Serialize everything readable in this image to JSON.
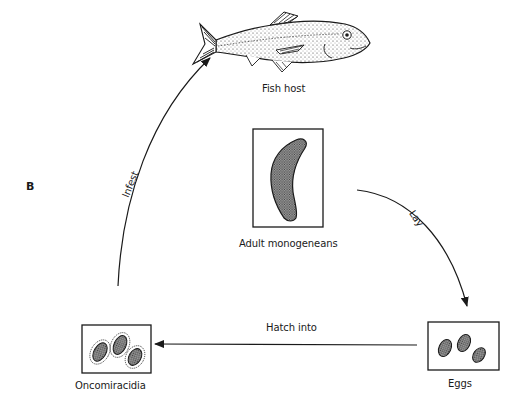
{
  "figure": {
    "panel_letter": "B"
  },
  "stages": [
    {
      "id": "fish-host",
      "label": "Fish host"
    },
    {
      "id": "adult",
      "label": "Adult monogeneans"
    },
    {
      "id": "eggs",
      "label": "Eggs"
    },
    {
      "id": "oncomiracidia",
      "label": "Oncomiracidia"
    }
  ],
  "arrows": [
    {
      "id": "lay",
      "from": "Adult monogeneans",
      "to": "Eggs",
      "label": "Lay"
    },
    {
      "id": "hatch",
      "from": "Eggs",
      "to": "Oncomiracidia",
      "label": "Hatch into"
    },
    {
      "id": "infest",
      "from": "Oncomiracidia",
      "to": "Fish host",
      "label": "Infest"
    }
  ],
  "colors": {
    "ink": "#1a1a1a",
    "background": "#ffffff",
    "stipple": "#555555"
  }
}
